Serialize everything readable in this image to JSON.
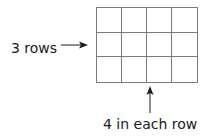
{
  "diagram": {
    "grid": {
      "rows": 3,
      "columns": 4,
      "line_color": "#7a7a7a"
    },
    "rows_label": "3 rows",
    "columns_label": "4 in each row",
    "arrows": [
      {
        "name": "right-arrow",
        "points_to": "grid-left-edge"
      },
      {
        "name": "up-arrow",
        "points_to": "grid-bottom-edge"
      }
    ]
  }
}
